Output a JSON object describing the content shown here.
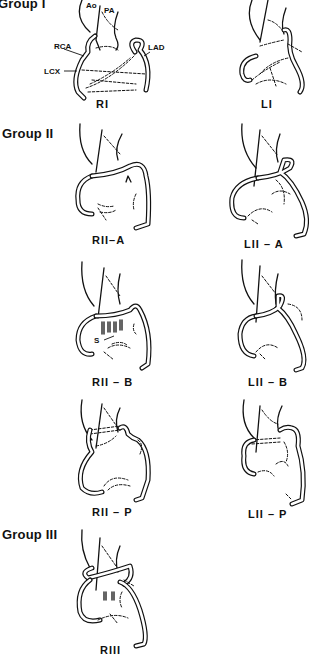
{
  "figure": {
    "groups": [
      {
        "title": "Group I"
      },
      {
        "title": "Group II"
      },
      {
        "title": "Group III"
      }
    ],
    "panels": [
      {
        "id": "RI",
        "caption": "RI",
        "group": "Group I"
      },
      {
        "id": "LI",
        "caption": "LI",
        "group": "Group I"
      },
      {
        "id": "RII-A",
        "caption": "RII–A",
        "group": "Group II"
      },
      {
        "id": "LII-A",
        "caption": "LII – A",
        "group": "Group II"
      },
      {
        "id": "RII-B",
        "caption": "RII – B",
        "group": "Group II"
      },
      {
        "id": "LII-B",
        "caption": "LII – B",
        "group": "Group II"
      },
      {
        "id": "RII-P",
        "caption": "RII – P",
        "group": "Group II"
      },
      {
        "id": "LII-P",
        "caption": "LII – P",
        "group": "Group II"
      },
      {
        "id": "RIII",
        "caption": "RIII",
        "group": "Group III"
      }
    ],
    "annotations": {
      "ao": "Ao",
      "pa": "PA",
      "rca": "RCA",
      "lad": "LAD",
      "lcx": "LCX",
      "s": "S"
    }
  }
}
